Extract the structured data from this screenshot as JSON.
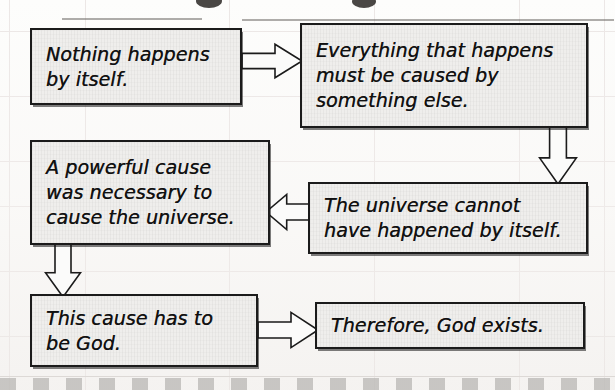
{
  "diagram": {
    "title_visible": false,
    "kind": "flowchart",
    "colors": {
      "box_fill": "#efeeec",
      "box_border": "#1b1b1b",
      "text": "#101010",
      "grid_line": "#ece7e6",
      "page_background": "#fdfdfc",
      "bottom_strip": "#b9b7b4"
    },
    "nodes": [
      {
        "id": "n1",
        "name": "nothing-happens-by-itself",
        "text": "Nothing happens\nby itself.",
        "x": 30,
        "y": 28,
        "w": 212,
        "h": 77
      },
      {
        "id": "n2",
        "name": "everything-must-be-caused",
        "text": "Everything that happens\nmust be caused by\nsomething else.",
        "x": 300,
        "y": 23,
        "w": 288,
        "h": 105
      },
      {
        "id": "n3",
        "name": "universe-cannot-have-happened-by-itself",
        "text": "The universe cannot\nhave happened by itself.",
        "x": 308,
        "y": 182,
        "w": 280,
        "h": 72
      },
      {
        "id": "n4",
        "name": "powerful-cause-necessary",
        "text": "A powerful cause\nwas necessary to\ncause the universe.",
        "x": 30,
        "y": 140,
        "w": 240,
        "h": 105
      },
      {
        "id": "n5",
        "name": "this-cause-has-to-be-god",
        "text": "This cause has to\nbe God.",
        "x": 30,
        "y": 294,
        "w": 228,
        "h": 73
      },
      {
        "id": "n6",
        "name": "therefore-god-exists",
        "text": "Therefore, God exists.",
        "x": 315,
        "y": 302,
        "w": 270,
        "h": 47
      }
    ],
    "arrows": [
      {
        "id": "a1",
        "name": "arrow-n1-to-n2",
        "direction": "right",
        "from": "n1",
        "to": "n2",
        "x": 242,
        "y": 42,
        "w": 60,
        "h": 38
      },
      {
        "id": "a2",
        "name": "arrow-n2-to-n3",
        "direction": "down",
        "from": "n2",
        "to": "n3",
        "x": 538,
        "y": 126,
        "w": 40,
        "h": 58
      },
      {
        "id": "a3",
        "name": "arrow-n3-to-n4",
        "direction": "left",
        "from": "n3",
        "to": "n4",
        "x": 266,
        "y": 192,
        "w": 46,
        "h": 40
      },
      {
        "id": "a4",
        "name": "arrow-n4-to-n5",
        "direction": "down",
        "from": "n4",
        "to": "n5",
        "x": 44,
        "y": 243,
        "w": 38,
        "h": 54
      },
      {
        "id": "a5",
        "name": "arrow-n5-to-n6",
        "direction": "right",
        "from": "n5",
        "to": "n6",
        "x": 258,
        "y": 310,
        "w": 60,
        "h": 40
      }
    ],
    "title_remnants": [
      {
        "x": 196,
        "y": -6,
        "w": 26,
        "h": 14
      },
      {
        "x": 352,
        "y": -5,
        "w": 24,
        "h": 13
      }
    ],
    "title_rules": [
      {
        "x": 62,
        "y": 18,
        "w": 140
      },
      {
        "x": 242,
        "y": 19,
        "w": 372
      }
    ],
    "grid": {
      "vertical_x": [
        9,
        85,
        229,
        374,
        519,
        604
      ],
      "horizontal_y": [
        31,
        96,
        161,
        206,
        271,
        336
      ]
    }
  }
}
